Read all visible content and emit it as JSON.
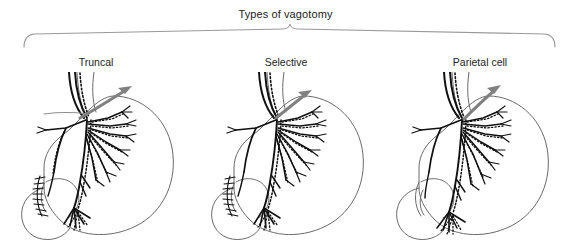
{
  "figure": {
    "title": "Types of vagotomy",
    "background_color": "#ffffff",
    "ink_color": "#111111",
    "outline_color": "#5a5a5a",
    "arrow_color": "#808080",
    "bracket_color": "#9a9a9a"
  },
  "bracket": {
    "name": "grouping-brace",
    "left_x": 23,
    "right_x": 555,
    "peak_x": 290
  },
  "panels": [
    {
      "label": "Truncal",
      "arrow": "resection-arrow",
      "vagal_trunks_divided": "at esophagus, above celiac and hepatic branches",
      "pyloroplasty": true,
      "denervation": "entire stomach, plus hepatic and celiac branches"
    },
    {
      "label": "Selective",
      "arrow": "resection-arrow",
      "vagal_trunks_divided": "below hepatic and celiac branches",
      "pyloroplasty": true,
      "denervation": "entire stomach only"
    },
    {
      "label": "Parietal cell",
      "arrow": "resection-arrow",
      "vagal_trunks_divided": "gastric branches to parietal cell mass only",
      "pyloroplasty": false,
      "denervation": "acid-secreting fundus and body; nerve of Latarjet to antrum preserved"
    }
  ]
}
